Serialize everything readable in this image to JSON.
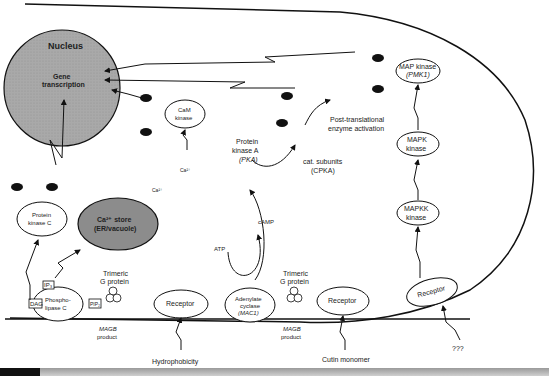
{
  "diagram": {
    "title": "",
    "colors": {
      "nucleus_fill": "#a8a8a8",
      "store_fill": "#8c8c8c",
      "tf_fill": "#111111",
      "line": "#111111"
    },
    "nucleus": {
      "title": "Nucleus",
      "content_line1": "Gene",
      "content_line2": "transcription"
    },
    "ca_store": {
      "line1": "Ca²⁺ store",
      "line2": "(ER/vacuole)"
    },
    "kinases": {
      "pkc": {
        "line1": "Protein",
        "line2": "kinase C"
      },
      "cam_kinase": {
        "line1": "CaM",
        "line2": "kinase"
      },
      "pka": {
        "line1": "Protein",
        "line2": "kinase A",
        "line3": "(PKA)"
      },
      "map_kinase": {
        "line1": "MAP kinase",
        "line2": "(PMK1)"
      },
      "mapk_kinase": {
        "line1": "MAPK",
        "line2": "kinase"
      },
      "mapkk_kinase": {
        "line1": "MAPKK",
        "line2": "kinase"
      }
    },
    "pka_subunits": {
      "cat": "Cat.",
      "reg": "Reg"
    },
    "cat_subunits": {
      "cat": "Cat",
      "label1": "cat. subunits",
      "label2": "(CPKA)"
    },
    "post_translational": {
      "line1": "Post-translational",
      "line2": "enzyme activation"
    },
    "small_labels": {
      "tf": "TF",
      "p": "P",
      "plus": "+",
      "cam": "CaM",
      "ca": "Ca²⁺",
      "camp": "cAMP",
      "atp": "ATP",
      "ip3": "IP₃",
      "dag": "DAG",
      "pip": "PIP₂"
    },
    "membrane": {
      "phospholipase": {
        "line1": "Phospho-",
        "line2": "lipase C"
      },
      "adenylate": {
        "line1": "Adenylate",
        "line2": "cyclase",
        "line3": "(MAC1)"
      },
      "receptor_label": "Receptor",
      "gprotein_label1": "Trimeric",
      "gprotein_label2": "G protein",
      "gprotein_subunits": {
        "alpha": "α",
        "beta": "β",
        "gamma": "γ"
      },
      "magb_line1": "MAGB",
      "magb_line2": "product"
    },
    "stimuli": {
      "hydrophobicity": "Hydrophobicity",
      "cutin": "Cutin monomer",
      "unknown": "???"
    }
  }
}
